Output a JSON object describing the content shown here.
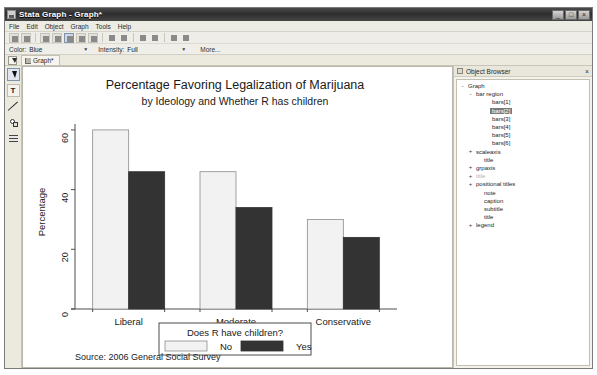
{
  "window": {
    "title": "Stata Graph - Graph*",
    "app_icon": "stata-graph-icon",
    "buttons": {
      "minimize": "_",
      "maximize": "□",
      "close": "×"
    }
  },
  "menubar": {
    "items": [
      "File",
      "Edit",
      "Object",
      "Graph",
      "Tools",
      "Help"
    ]
  },
  "toolbar": {
    "buttons": [
      "save-icon",
      "print-icon",
      "copy-icon",
      "paste-icon",
      "select-tool-icon",
      "grid-icon",
      "text-tool-icon",
      "undo-icon",
      "redo-icon",
      "zoom-in-icon",
      "zoom-out-icon",
      "record-icon",
      "play-icon"
    ]
  },
  "propertybar": {
    "color_label": "Color:",
    "color_value": "Blue",
    "intensity_label": "Intensity:",
    "intensity_value": "Full",
    "more_label": "More..."
  },
  "tabstrip": {
    "pointer": "pointer-icon",
    "tabs": [
      {
        "label": "Graph*",
        "icon": "graph-icon"
      }
    ]
  },
  "palette": {
    "tools": [
      {
        "name": "pointer-tool",
        "glyph": ""
      },
      {
        "name": "text-tool",
        "glyph": "T"
      },
      {
        "name": "line-tool",
        "glyph": ""
      },
      {
        "name": "shape-tool",
        "glyph": ""
      },
      {
        "name": "grid-tool",
        "glyph": ""
      }
    ]
  },
  "object_browser": {
    "title": "Object Browser",
    "close_label": "×",
    "nodes": [
      {
        "label": "Graph",
        "depth": 0,
        "toggle": "-",
        "selected": false,
        "dim": false
      },
      {
        "label": "bar region",
        "depth": 1,
        "toggle": "-",
        "selected": false,
        "dim": false
      },
      {
        "label": "bars[1]",
        "depth": 3,
        "toggle": "",
        "selected": false,
        "dim": false
      },
      {
        "label": "bars[2]",
        "depth": 3,
        "toggle": "",
        "selected": true,
        "dim": false
      },
      {
        "label": "bars[3]",
        "depth": 3,
        "toggle": "",
        "selected": false,
        "dim": false
      },
      {
        "label": "bars[4]",
        "depth": 3,
        "toggle": "",
        "selected": false,
        "dim": false
      },
      {
        "label": "bars[5]",
        "depth": 3,
        "toggle": "",
        "selected": false,
        "dim": false
      },
      {
        "label": "bars[6]",
        "depth": 3,
        "toggle": "",
        "selected": false,
        "dim": false
      },
      {
        "label": "scaleaxis",
        "depth": 1,
        "toggle": "+",
        "selected": false,
        "dim": false
      },
      {
        "label": "title",
        "depth": 2,
        "toggle": "",
        "selected": false,
        "dim": false
      },
      {
        "label": "grpaxis",
        "depth": 1,
        "toggle": "+",
        "selected": false,
        "dim": false
      },
      {
        "label": "title",
        "depth": 1,
        "toggle": "+",
        "selected": false,
        "dim": true
      },
      {
        "label": "positional titles",
        "depth": 1,
        "toggle": "+",
        "selected": false,
        "dim": false
      },
      {
        "label": "note",
        "depth": 2,
        "toggle": "",
        "selected": false,
        "dim": false
      },
      {
        "label": "caption",
        "depth": 2,
        "toggle": "",
        "selected": false,
        "dim": false
      },
      {
        "label": "subtitle",
        "depth": 2,
        "toggle": "",
        "selected": false,
        "dim": false
      },
      {
        "label": "title",
        "depth": 2,
        "toggle": "",
        "selected": false,
        "dim": false
      },
      {
        "label": "legend",
        "depth": 1,
        "toggle": "+",
        "selected": false,
        "dim": false
      }
    ]
  },
  "chart_data": {
    "type": "bar",
    "title": "Percentage Favoring Legalization of Marijuana",
    "subtitle": "by Ideology and Whether R has children",
    "xlabel": "",
    "ylabel": "Percentage",
    "categories": [
      "Liberal",
      "Moderate",
      "Conservative"
    ],
    "series": [
      {
        "name": "No",
        "values": [
          60,
          46,
          30
        ],
        "color": "#f2f2f2",
        "edge": "#8c8c8c"
      },
      {
        "name": "Yes",
        "values": [
          46,
          34,
          24
        ],
        "color": "#333333",
        "edge": "#333333"
      }
    ],
    "ylim": [
      0,
      65
    ],
    "yticks": [
      0,
      20,
      40,
      60
    ],
    "ytick_labels": [
      "0",
      "20",
      "40",
      "60"
    ],
    "grid": false,
    "legend": {
      "position": "bottom",
      "title": "Does R have children?",
      "entries": [
        "No",
        "Yes"
      ]
    },
    "note": "Source: 2006 General Social Survey"
  }
}
